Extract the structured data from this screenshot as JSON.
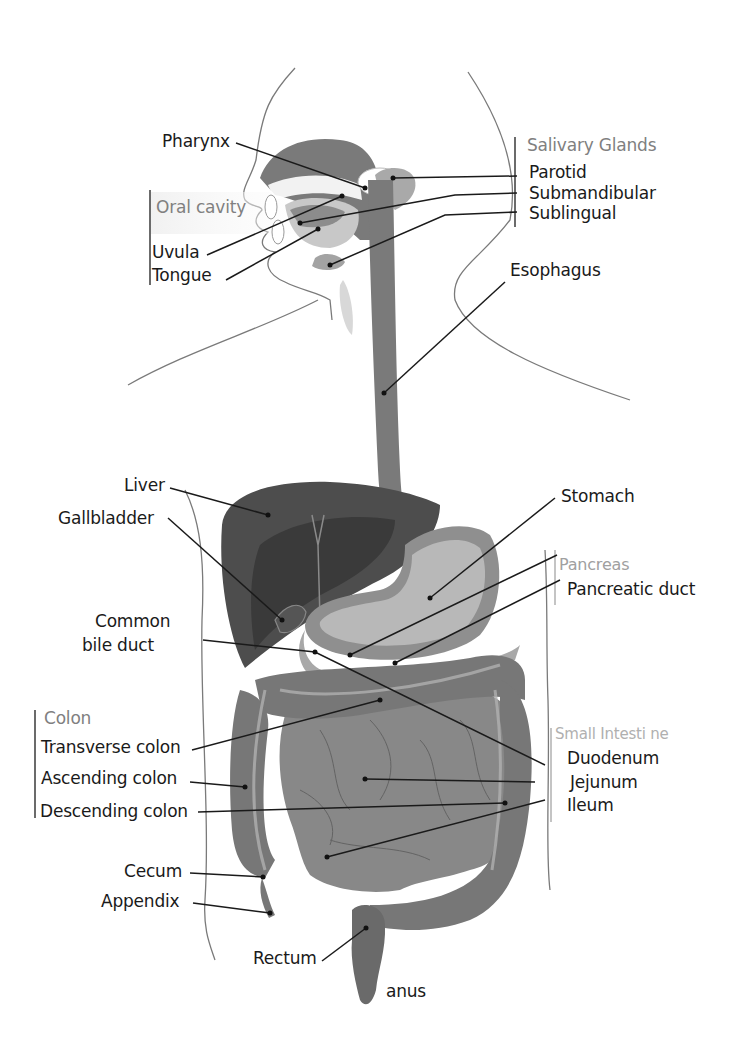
{
  "diagram": {
    "colors": {
      "background": "#ffffff",
      "outline": "#6e6e6e",
      "liver": "#4a4a4a",
      "liver_inner": "#3b3b3b",
      "tract": "#7a7a7a",
      "stomach": "#9a9a9a",
      "stomach_inner": "#b5b5b5",
      "intestine": "#888888",
      "colon": "#777777",
      "gland": "#a9a9a9",
      "leader_line": "#1a1a1a",
      "group_header": "#808080",
      "group_header_light": "#b0b0b0"
    },
    "groups": {
      "oral_cavity": {
        "header": "Oral cavity",
        "items": [
          "Uvula",
          "Tongue"
        ]
      },
      "salivary_glands": {
        "header": "Salivary Glands",
        "items": [
          "Parotid",
          "Submandibular",
          "Sublingual"
        ]
      },
      "pancreas": {
        "header": "Pancreas",
        "items": [
          "Pancreatic duct"
        ]
      },
      "colon": {
        "header": "Colon",
        "items": [
          "Transverse colon",
          "Ascending colon",
          "Descending colon"
        ]
      },
      "small_intestine": {
        "header": "Small Intesti ne",
        "items": [
          "Duodenum",
          "Jejunum",
          "Ileum"
        ]
      }
    },
    "labels": {
      "pharynx": "Pharynx",
      "esophagus": "Esophagus",
      "liver": "Liver",
      "gallbladder": "Gallbladder",
      "stomach": "Stomach",
      "common_bile_duct_line1": "Common",
      "common_bile_duct_line2": "bile duct",
      "cecum": "Cecum",
      "appendix": "Appendix",
      "rectum": "Rectum",
      "anus": "anus"
    }
  }
}
